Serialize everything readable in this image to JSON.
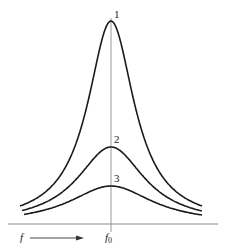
{
  "diagram": {
    "axis_label_x": "f",
    "center_label": "f",
    "center_label_sub": "0",
    "curves": [
      {
        "label": "1",
        "peak_y": 21,
        "end_y": 206
      },
      {
        "label": "2",
        "peak_y": 147,
        "end_y": 211
      },
      {
        "label": "3",
        "peak_y": 186,
        "end_y": 215
      }
    ],
    "colors": {
      "curve": "#1a1a1a",
      "axis": "#888888",
      "center_line": "#999999"
    }
  }
}
